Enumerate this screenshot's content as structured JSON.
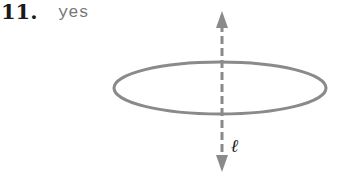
{
  "problem": {
    "number": "11.",
    "answer": "yes"
  },
  "figure": {
    "axis_label": "ℓ",
    "colors": {
      "shape": "#8a8a8a",
      "text": "#1a1a1a",
      "answer_text": "#777777"
    }
  }
}
